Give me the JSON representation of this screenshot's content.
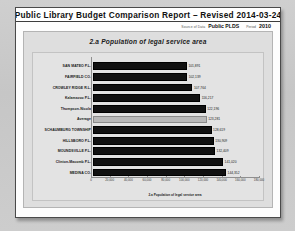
{
  "document": {
    "title": "Public Library Budget Comparison Report – Revised 2014-03-24",
    "source_label": "Source of Data",
    "source_value": "Public PLDS",
    "period_label": "Period",
    "period_value": "2010"
  },
  "chart_data": {
    "type": "bar",
    "orientation": "horizontal",
    "title": "2.a Population of legal service area",
    "xlabel": "2.a Population of legal service area",
    "ylabel": "",
    "xlim": [
      0,
      180000
    ],
    "grid": false,
    "legend": false,
    "tick_labels": [
      "0",
      "20,000",
      "40,000",
      "60,000",
      "80,000",
      "100,000",
      "120,000",
      "140,000",
      "160,000",
      "180,000"
    ],
    "tick_values": [
      0,
      20000,
      40000,
      60000,
      80000,
      100000,
      120000,
      140000,
      160000,
      180000
    ],
    "categories": [
      "SAN MATEO P.L.",
      "FAIRFIELD CO.",
      "CROWLEY RIDGE R.L.",
      "Kalamazoo P.L.",
      "Thompson-Nicola",
      "Average",
      "SCHAUMBURG TOWNSHIP",
      "HILLSBORO P.L.",
      "MOUNDSVILLE P.L.",
      "Clinton-Macomb P.L.",
      "MEDINA CO."
    ],
    "values": [
      101891,
      102139,
      107764,
      116217,
      122196,
      123281,
      128619,
      130909,
      132409,
      141020,
      144352
    ],
    "value_labels": [
      "101,891",
      "102,139",
      "107,764",
      "116,217",
      "122,196",
      "123,281",
      "128,619",
      "130,909",
      "132,409",
      "141,020",
      "144,352"
    ],
    "highlight_index": 5,
    "bar_color": "#111111",
    "highlight_color": "#b9b9b9"
  }
}
